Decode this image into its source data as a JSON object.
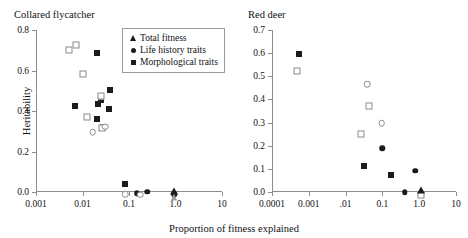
{
  "figure": {
    "axis_title_x": "Proportion of fitness explained",
    "axis_title_y": "Heritability",
    "marker_color": "#1b1b1b",
    "open_marker_color": "#8a8a8a",
    "axis_color": "#8d8d8d"
  },
  "legend": {
    "items": [
      {
        "label": "Total fitness",
        "marker": "filled-triangle-icon"
      },
      {
        "label": "Life history traits",
        "marker": "filled-circle-icon"
      },
      {
        "label": "Morphological traits",
        "marker": "filled-square-icon"
      }
    ]
  },
  "chart_data": [
    {
      "type": "scatter",
      "title": "Collared flycatcher",
      "xlabel": "Proportion of fitness explained",
      "ylabel": "Heritability",
      "xscale": "log",
      "xlim": [
        0.001,
        10
      ],
      "ylim": [
        0.0,
        0.8
      ],
      "xticks": [
        0.001,
        0.01,
        0.1,
        1.0,
        10
      ],
      "xticklabels": [
        "0.001",
        "0.01",
        "0.1",
        "1.0",
        "10"
      ],
      "yticks": [
        0.0,
        0.2,
        0.4,
        0.6,
        0.8
      ],
      "yticklabels": [
        "0.0",
        "0.2",
        "0.4",
        "0.6",
        "0.8"
      ],
      "grid": false,
      "series": [
        {
          "name": "Morphological traits",
          "marker": "filled-square",
          "points": [
            {
              "x": 0.0068,
              "y": 0.425
            },
            {
              "x": 0.0205,
              "y": 0.685
            },
            {
              "x": 0.0205,
              "y": 0.362
            },
            {
              "x": 0.0215,
              "y": 0.435
            },
            {
              "x": 0.0255,
              "y": 0.455
            },
            {
              "x": 0.0275,
              "y": 0.322
            },
            {
              "x": 0.0375,
              "y": 0.412
            },
            {
              "x": 0.0385,
              "y": 0.505
            },
            {
              "x": 0.083,
              "y": 0.04
            }
          ]
        },
        {
          "name": "Morphological traits (open)",
          "marker": "open-square",
          "points": [
            {
              "x": 0.0052,
              "y": 0.7
            },
            {
              "x": 0.0072,
              "y": 0.725
            },
            {
              "x": 0.0105,
              "y": 0.585
            },
            {
              "x": 0.0128,
              "y": 0.368
            },
            {
              "x": 0.0245,
              "y": 0.475
            },
            {
              "x": 0.0265,
              "y": 0.318
            }
          ]
        },
        {
          "name": "Life history traits",
          "marker": "filled-circle",
          "points": [
            {
              "x": 0.145,
              "y": -0.005
            },
            {
              "x": 0.155,
              "y": -0.008
            },
            {
              "x": 0.245,
              "y": 0.002
            },
            {
              "x": 0.95,
              "y": -0.012
            }
          ]
        },
        {
          "name": "Life history traits (open)",
          "marker": "open-circle",
          "points": [
            {
              "x": 0.0165,
              "y": 0.295
            },
            {
              "x": 0.0305,
              "y": 0.322
            },
            {
              "x": 0.082,
              "y": -0.012
            },
            {
              "x": 0.175,
              "y": -0.014
            }
          ]
        },
        {
          "name": "Total fitness",
          "marker": "filled-triangle",
          "points": [
            {
              "x": 0.95,
              "y": 0.005
            }
          ]
        },
        {
          "name": "Total fitness (open)",
          "marker": "open-triangle",
          "points": [
            {
              "x": 0.95,
              "y": -0.025
            }
          ]
        }
      ]
    },
    {
      "type": "scatter",
      "title": "Red deer",
      "xlabel": "Proportion of fitness explained",
      "ylabel": "Heritability",
      "xscale": "log",
      "xlim": [
        0.0001,
        10
      ],
      "ylim": [
        0.0,
        0.7
      ],
      "xticks": [
        0.0001,
        0.001,
        0.01,
        0.1,
        1.0,
        10
      ],
      "xticklabels": [
        "0.0001",
        "0.001",
        ".01",
        "0.1",
        "1.0",
        "10"
      ],
      "yticks": [
        0.0,
        0.1,
        0.2,
        0.3,
        0.4,
        0.5,
        0.6,
        0.7
      ],
      "yticklabels": [
        "0.0",
        "0.1",
        "0.2",
        "0.3",
        "0.4",
        "0.5",
        "0.6",
        "0.7"
      ],
      "grid": false,
      "series": [
        {
          "name": "Morphological traits",
          "marker": "filled-square",
          "points": [
            {
              "x": 0.00055,
              "y": 0.598
            },
            {
              "x": 0.032,
              "y": 0.112
            },
            {
              "x": 0.175,
              "y": 0.075
            }
          ]
        },
        {
          "name": "Morphological traits (open)",
          "marker": "open-square",
          "points": [
            {
              "x": 0.00048,
              "y": 0.522
            },
            {
              "x": 0.026,
              "y": 0.25
            },
            {
              "x": 0.043,
              "y": 0.372
            },
            {
              "x": 1.15,
              "y": -0.012
            }
          ]
        },
        {
          "name": "Life history traits",
          "marker": "filled-circle",
          "points": [
            {
              "x": 0.098,
              "y": 0.188
            },
            {
              "x": 0.4,
              "y": 0.0
            },
            {
              "x": 0.78,
              "y": 0.092
            }
          ]
        },
        {
          "name": "Life history traits (open)",
          "marker": "open-circle",
          "points": [
            {
              "x": 0.038,
              "y": 0.465
            },
            {
              "x": 0.095,
              "y": 0.298
            }
          ]
        },
        {
          "name": "Total fitness",
          "marker": "filled-triangle",
          "points": [
            {
              "x": 1.15,
              "y": 0.01
            }
          ]
        }
      ]
    }
  ]
}
